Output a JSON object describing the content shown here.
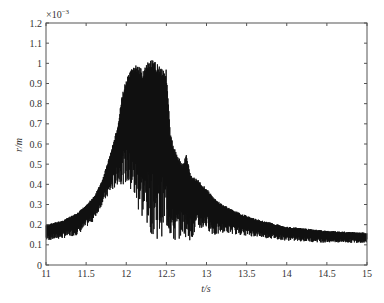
{
  "chart_data": {
    "type": "line",
    "title": "",
    "xlabel": "t/s",
    "ylabel": "r/m",
    "y_scale_multiplier": "×10^-3",
    "xlim": [
      11,
      15
    ],
    "ylim": [
      0,
      1.2
    ],
    "xticks": [
      11,
      11.5,
      12,
      12.5,
      13,
      13.5,
      14,
      14.5,
      15
    ],
    "yticks": [
      0,
      0.1,
      0.2,
      0.3,
      0.4,
      0.5,
      0.6,
      0.7,
      0.8,
      0.9,
      1,
      1.1,
      1.2
    ],
    "grid": false,
    "legend": null,
    "line_color": "#111111",
    "series": [
      {
        "name": "r upper envelope",
        "x": [
          11.0,
          11.2,
          11.4,
          11.6,
          11.7,
          11.8,
          11.9,
          11.95,
          12.0,
          12.1,
          12.2,
          12.3,
          12.4,
          12.5,
          12.55,
          12.6,
          12.7,
          12.75,
          12.8,
          12.9,
          13.0,
          13.1,
          13.2,
          13.4,
          13.6,
          13.8,
          14.0,
          14.5,
          15.0
        ],
        "values": [
          0.2,
          0.22,
          0.26,
          0.34,
          0.42,
          0.55,
          0.7,
          0.85,
          0.92,
          1.0,
          0.97,
          1.02,
          1.0,
          0.97,
          0.65,
          0.58,
          0.5,
          0.55,
          0.45,
          0.42,
          0.38,
          0.33,
          0.3,
          0.26,
          0.23,
          0.21,
          0.19,
          0.17,
          0.16
        ]
      },
      {
        "name": "r lower envelope",
        "x": [
          11.0,
          11.2,
          11.4,
          11.6,
          11.7,
          11.8,
          11.9,
          12.0,
          12.1,
          12.2,
          12.3,
          12.4,
          12.5,
          12.6,
          12.7,
          12.8,
          12.9,
          13.0,
          13.1,
          13.2,
          13.4,
          13.6,
          13.8,
          14.0,
          14.5,
          15.0
        ],
        "values": [
          0.12,
          0.13,
          0.15,
          0.22,
          0.3,
          0.35,
          0.4,
          0.4,
          0.3,
          0.22,
          0.16,
          0.12,
          0.17,
          0.1,
          0.15,
          0.12,
          0.17,
          0.18,
          0.14,
          0.16,
          0.15,
          0.14,
          0.13,
          0.12,
          0.11,
          0.11
        ]
      }
    ]
  }
}
